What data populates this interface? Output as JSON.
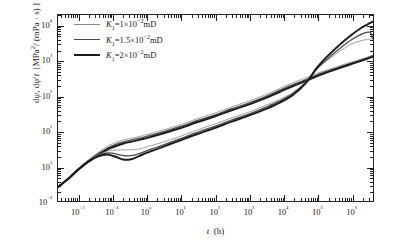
{
  "chart_data": {
    "type": "line",
    "title": "",
    "xlabel": "t (h)",
    "ylabel": "dψ, dψ′t [MPa²/ (mPa · s) ]",
    "xscale": "log",
    "yscale": "log",
    "xlim": [
      0.0025,
      4500000
    ],
    "ylim": [
      0.1,
      20000
    ],
    "xticks": [
      "10⁻²",
      "10⁻¹",
      "10⁰",
      "10¹",
      "10²",
      "10³",
      "10⁴",
      "10⁵",
      "10⁶"
    ],
    "xtick_values": [
      0.01,
      0.1,
      1,
      10,
      100,
      1000,
      10000,
      100000,
      1000000
    ],
    "yticks": [
      "10⁻¹",
      "10⁰",
      "10¹",
      "10²",
      "10³",
      "10⁴"
    ],
    "ytick_values": [
      0.1,
      1,
      10,
      100,
      1000,
      10000
    ],
    "grid": false,
    "legend_position": "top-left",
    "legend": [
      {
        "label": "K₁=1×10⁻²mD",
        "color": "#8a8a8a",
        "width": 0.8
      },
      {
        "label": "K₁=1.5×10⁻²mD",
        "color": "#4a4a4a",
        "width": 1.3
      },
      {
        "label": "K₁=2×10⁻²mD",
        "color": "#1c1c1c",
        "width": 2.2
      }
    ],
    "series": [
      {
        "name": "pressure K1=1e-2",
        "kind": "pressure",
        "color": "#8a8a8a",
        "width": 0.8,
        "points": [
          [
            0.0025,
            0.25
          ],
          [
            0.005,
            0.45
          ],
          [
            0.01,
            0.85
          ],
          [
            0.02,
            1.5
          ],
          [
            0.04,
            2.5
          ],
          [
            0.07,
            3.6
          ],
          [
            0.1,
            4.3
          ],
          [
            0.2,
            5.4
          ],
          [
            0.4,
            6.3
          ],
          [
            0.7,
            7.1
          ],
          [
            1,
            7.8
          ],
          [
            3,
            10.5
          ],
          [
            10,
            15
          ],
          [
            30,
            22
          ],
          [
            100,
            32
          ],
          [
            300,
            47
          ],
          [
            1000,
            70
          ],
          [
            3000,
            105
          ],
          [
            8000,
            160
          ],
          [
            20000,
            235
          ],
          [
            50000,
            330
          ],
          [
            100000,
            430
          ],
          [
            300000,
            620
          ],
          [
            1000000,
            900
          ],
          [
            3000000,
            1250
          ],
          [
            4500000,
            1450
          ]
        ]
      },
      {
        "name": "pressure K1=1.5e-2",
        "kind": "pressure",
        "color": "#4a4a4a",
        "width": 1.3,
        "points": [
          [
            0.0025,
            0.25
          ],
          [
            0.005,
            0.44
          ],
          [
            0.01,
            0.82
          ],
          [
            0.02,
            1.42
          ],
          [
            0.04,
            2.3
          ],
          [
            0.07,
            3.2
          ],
          [
            0.1,
            3.8
          ],
          [
            0.2,
            4.8
          ],
          [
            0.4,
            5.6
          ],
          [
            0.7,
            6.3
          ],
          [
            1,
            6.9
          ],
          [
            3,
            9.3
          ],
          [
            10,
            13.3
          ],
          [
            30,
            19.5
          ],
          [
            100,
            28
          ],
          [
            300,
            42
          ],
          [
            1000,
            62
          ],
          [
            3000,
            93
          ],
          [
            8000,
            142
          ],
          [
            20000,
            208
          ],
          [
            50000,
            295
          ],
          [
            100000,
            390
          ],
          [
            300000,
            570
          ],
          [
            1000000,
            840
          ],
          [
            3000000,
            1180
          ],
          [
            4500000,
            1380
          ]
        ]
      },
      {
        "name": "pressure K1=2e-2",
        "kind": "pressure",
        "color": "#1c1c1c",
        "width": 2.0,
        "points": [
          [
            0.0025,
            0.25
          ],
          [
            0.005,
            0.43
          ],
          [
            0.01,
            0.79
          ],
          [
            0.02,
            1.35
          ],
          [
            0.04,
            2.1
          ],
          [
            0.07,
            2.9
          ],
          [
            0.1,
            3.4
          ],
          [
            0.2,
            4.3
          ],
          [
            0.4,
            5.0
          ],
          [
            0.7,
            5.7
          ],
          [
            1,
            6.2
          ],
          [
            3,
            8.4
          ],
          [
            10,
            12
          ],
          [
            30,
            17.5
          ],
          [
            100,
            25.5
          ],
          [
            300,
            38
          ],
          [
            1000,
            56
          ],
          [
            3000,
            84
          ],
          [
            8000,
            128
          ],
          [
            20000,
            188
          ],
          [
            50000,
            270
          ],
          [
            100000,
            360
          ],
          [
            300000,
            530
          ],
          [
            1000000,
            790
          ],
          [
            3000000,
            1120
          ],
          [
            4500000,
            1320
          ]
        ]
      },
      {
        "name": "derivative K1=1e-2",
        "kind": "derivative",
        "color": "#8a8a8a",
        "width": 0.8,
        "points": [
          [
            0.0025,
            0.25
          ],
          [
            0.005,
            0.45
          ],
          [
            0.01,
            0.85
          ],
          [
            0.02,
            1.45
          ],
          [
            0.04,
            2.1
          ],
          [
            0.07,
            2.6
          ],
          [
            0.1,
            2.8
          ],
          [
            0.2,
            2.85
          ],
          [
            0.4,
            2.9
          ],
          [
            0.7,
            3.1
          ],
          [
            1,
            3.5
          ],
          [
            2,
            4.2
          ],
          [
            5,
            5.6
          ],
          [
            10,
            7.0
          ],
          [
            30,
            10.5
          ],
          [
            100,
            15.5
          ],
          [
            300,
            23
          ],
          [
            1000,
            34
          ],
          [
            3000,
            52
          ],
          [
            8000,
            78
          ],
          [
            20000,
            125
          ],
          [
            50000,
            260
          ],
          [
            100000,
            560
          ],
          [
            200000,
            1000
          ],
          [
            500000,
            1900
          ],
          [
            1000000,
            2900
          ],
          [
            2000000,
            3700
          ],
          [
            3500000,
            4100
          ],
          [
            4500000,
            4200
          ]
        ]
      },
      {
        "name": "derivative K1=1.5e-2",
        "kind": "derivative",
        "color": "#4a4a4a",
        "width": 1.3,
        "points": [
          [
            0.0025,
            0.25
          ],
          [
            0.005,
            0.44
          ],
          [
            0.01,
            0.82
          ],
          [
            0.02,
            1.4
          ],
          [
            0.04,
            2.0
          ],
          [
            0.07,
            2.35
          ],
          [
            0.1,
            2.3
          ],
          [
            0.15,
            2.1
          ],
          [
            0.25,
            1.95
          ],
          [
            0.4,
            2.0
          ],
          [
            0.7,
            2.35
          ],
          [
            1,
            2.7
          ],
          [
            2,
            3.4
          ],
          [
            5,
            4.7
          ],
          [
            10,
            6.0
          ],
          [
            30,
            9.0
          ],
          [
            100,
            13.5
          ],
          [
            300,
            20
          ],
          [
            1000,
            30
          ],
          [
            3000,
            46
          ],
          [
            8000,
            70
          ],
          [
            20000,
            115
          ],
          [
            50000,
            250
          ],
          [
            100000,
            580
          ],
          [
            200000,
            1100
          ],
          [
            500000,
            2300
          ],
          [
            1000000,
            3800
          ],
          [
            2000000,
            5600
          ],
          [
            3000000,
            6400
          ],
          [
            3800000,
            6300
          ],
          [
            4500000,
            4200
          ]
        ]
      },
      {
        "name": "derivative K1=2e-2",
        "kind": "derivative",
        "color": "#1c1c1c",
        "width": 2.0,
        "points": [
          [
            0.0025,
            0.25
          ],
          [
            0.005,
            0.43
          ],
          [
            0.01,
            0.8
          ],
          [
            0.02,
            1.35
          ],
          [
            0.04,
            1.9
          ],
          [
            0.07,
            2.1
          ],
          [
            0.1,
            1.95
          ],
          [
            0.15,
            1.7
          ],
          [
            0.22,
            1.5
          ],
          [
            0.35,
            1.55
          ],
          [
            0.6,
            1.9
          ],
          [
            1,
            2.35
          ],
          [
            2,
            3.0
          ],
          [
            5,
            4.2
          ],
          [
            10,
            5.4
          ],
          [
            30,
            8.0
          ],
          [
            100,
            12
          ],
          [
            300,
            18
          ],
          [
            1000,
            27
          ],
          [
            3000,
            41
          ],
          [
            8000,
            63
          ],
          [
            20000,
            105
          ],
          [
            50000,
            240
          ],
          [
            100000,
            620
          ],
          [
            200000,
            1300
          ],
          [
            500000,
            3000
          ],
          [
            1000000,
            5200
          ],
          [
            2000000,
            8500
          ],
          [
            3500000,
            11500
          ],
          [
            4500000,
            13000
          ]
        ]
      }
    ]
  },
  "axis_titles": {
    "x": {
      "symbol": "t",
      "unit": "(h)"
    },
    "y": {
      "sym1": "dψ",
      "sym2": "dψ′",
      "sym2_sub": "t",
      "bracket_open": "[MPa",
      "bracket_exp": "2",
      "bracket_mid": "/ (mPa · s) ]"
    }
  },
  "legend_entries": [
    {
      "sym": "K",
      "sub": "1",
      "eq": "=1×10",
      "exp": "−2",
      "unit": "mD"
    },
    {
      "sym": "K",
      "sub": "1",
      "eq": "=1.5×10",
      "exp": "−2",
      "unit": "mD"
    },
    {
      "sym": "K",
      "sub": "1",
      "eq": "=2×10",
      "exp": "−2",
      "unit": "mD"
    }
  ]
}
